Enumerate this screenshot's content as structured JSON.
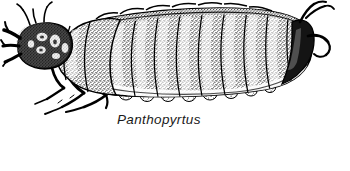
{
  "figure": {
    "kind": "scientific-line-illustration",
    "technique": "pen-and-ink stipple",
    "background_color": "#ffffff",
    "ink_color": "#000000",
    "stipple_color": "#2b2b2b",
    "width_px": 350,
    "height_px": 171
  },
  "caption": {
    "text": "Panthopyrtus",
    "style": "italic",
    "x_px": 117,
    "y_px": 112
  },
  "anatomy": {
    "head": {
      "label": "head-capsule",
      "shading": "dark with pale mottled markings",
      "x_px": 18,
      "y_px": 28
    },
    "mandibles": {
      "label": "mandibles",
      "shading": "solid black forked",
      "x_px": 8,
      "y_px": 30
    },
    "antennae": {
      "label": "antennae",
      "shading": "fine black lines",
      "x_px": 10,
      "y_px": 22
    },
    "thorax": {
      "label": "thoracic-segments",
      "segment_count": 3,
      "x_px": 62,
      "y_px": 18
    },
    "abdomen": {
      "label": "abdominal-segments",
      "segment_count": 9,
      "x_px": 120,
      "y_px": 14
    },
    "legs": {
      "label": "thoracic-legs",
      "count": 3,
      "x_px": 40,
      "y_px": 75
    },
    "prolegs": {
      "label": "ventral-lobes",
      "count": 8,
      "x_px": 150,
      "y_px": 88
    },
    "cerci": {
      "label": "terminal-cerci",
      "shading": "solid black hooked",
      "x_px": 300,
      "y_px": 12
    }
  }
}
